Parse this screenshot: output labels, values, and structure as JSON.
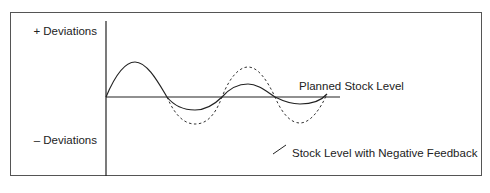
{
  "diagram": {
    "y_axis_labels": {
      "top": "+ Deviations",
      "bottom": "– Deviations"
    },
    "baseline_label": "Planned Stock Level",
    "legend_label": "Stock Level with Negative Feedback",
    "colors": {
      "frame": "#555555",
      "line": "#222222",
      "text": "#222222",
      "background": "#ffffff"
    },
    "series": [
      {
        "name": "Planned Stock Level",
        "style": "solid-straight"
      },
      {
        "name": "Stock Level with Negative Feedback",
        "style": "solid-damped-wave"
      },
      {
        "name": "Stock level without feedback",
        "style": "dashed-wave"
      }
    ]
  }
}
